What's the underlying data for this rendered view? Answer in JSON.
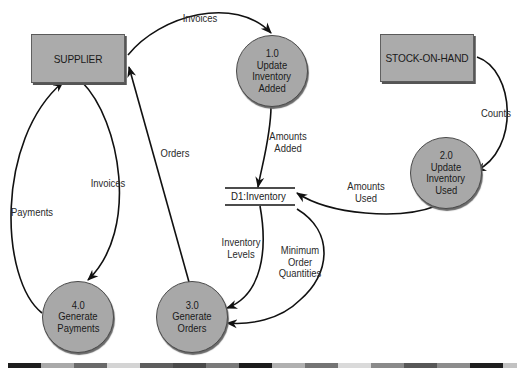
{
  "diagram": {
    "type": "data-flow-diagram",
    "entities": [
      {
        "id": "supplier",
        "label": "SUPPLIER"
      },
      {
        "id": "stock",
        "label": "STOCK-ON-HAND"
      }
    ],
    "processes": [
      {
        "id": "p1",
        "number": "1.0",
        "lines": [
          "Update",
          "Inventory",
          "Added"
        ]
      },
      {
        "id": "p2",
        "number": "2.0",
        "lines": [
          "Update",
          "Inventory",
          "Used"
        ]
      },
      {
        "id": "p3",
        "number": "3.0",
        "lines": [
          "Generate",
          "Orders"
        ]
      },
      {
        "id": "p4",
        "number": "4.0",
        "lines": [
          "Generate",
          "Payments"
        ]
      }
    ],
    "data_store": {
      "id": "d1",
      "label": "D1:Inventory"
    },
    "flows": [
      {
        "from": "SUPPLIER",
        "to": "1.0",
        "label_lines": [
          "Invoices"
        ]
      },
      {
        "from": "1.0",
        "to": "D1:Inventory",
        "label_lines": [
          "Amounts",
          "Added"
        ]
      },
      {
        "from": "STOCK-ON-HAND",
        "to": "2.0",
        "label_lines": [
          "Counts"
        ]
      },
      {
        "from": "2.0",
        "to": "D1:Inventory",
        "label_lines": [
          "Amounts",
          "Used"
        ]
      },
      {
        "from": "D1:Inventory",
        "to": "3.0",
        "label_lines": [
          "Inventory",
          "Levels"
        ]
      },
      {
        "from": "D1:Inventory",
        "to": "3.0",
        "label_lines": [
          "Minimum",
          "Order",
          "Quantities"
        ]
      },
      {
        "from": "3.0",
        "to": "SUPPLIER",
        "label_lines": [
          "Orders"
        ]
      },
      {
        "from": "SUPPLIER",
        "to": "4.0",
        "label_lines": [
          "Invoices"
        ]
      },
      {
        "from": "4.0",
        "to": "SUPPLIER",
        "label_lines": [
          "Payments"
        ]
      }
    ]
  },
  "colors": {
    "entity_fill": "#ababab",
    "process_fill": "#a8a8a8",
    "line": "#111111",
    "bar_segments": [
      "#1e1e1e",
      "#a9a9a9",
      "#6a6a6a",
      "#d4d4d4",
      "#5e5e5e",
      "#4a4a4a",
      "#7a7a7a",
      "#1c1c1c",
      "#b0b0b0",
      "#747474",
      "#dadada",
      "#8a8a8a",
      "#575757",
      "#8c8c8c",
      "#1f1f1f",
      "#c2c2c2"
    ]
  }
}
